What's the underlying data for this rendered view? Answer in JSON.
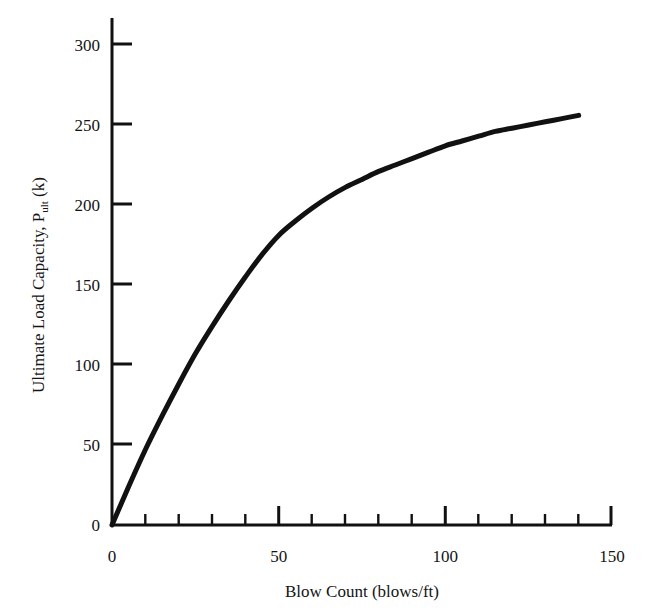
{
  "figure": {
    "cut_off_header_text": "",
    "background_color": "#ffffff",
    "ink_color": "#111111"
  },
  "axes": {
    "x": {
      "title": "Blow Count (blows/ft)",
      "tick_labels": [
        "0",
        "50",
        "100",
        "150"
      ],
      "tick_values": [
        0,
        50,
        100,
        150
      ],
      "minor_tick_step": 10,
      "range": [
        0,
        150
      ]
    },
    "y": {
      "title_main": "Ultimate Load Capacity, P",
      "title_sub": "ult",
      "title_unit": " (k)",
      "tick_labels": [
        "0",
        "50",
        "100",
        "150",
        "200",
        "250",
        "300"
      ],
      "tick_values": [
        0,
        50,
        100,
        150,
        200,
        250,
        300
      ],
      "range": [
        0,
        310
      ]
    }
  },
  "chart_data": {
    "type": "line",
    "title": "",
    "xlabel": "Blow Count (blows/ft)",
    "ylabel": "Ultimate Load Capacity, P_ult (k)",
    "xlim": [
      0,
      150
    ],
    "ylim": [
      0,
      310
    ],
    "grid": false,
    "legend": null,
    "line_color": "#111111",
    "line_width_px": 5,
    "series": [
      {
        "name": "Ultimate Load Capacity vs Blow Count",
        "x": [
          0,
          5,
          10,
          15,
          20,
          25,
          30,
          35,
          40,
          45,
          50,
          55,
          60,
          65,
          70,
          75,
          80,
          85,
          90,
          95,
          100,
          105,
          110,
          115,
          120,
          125,
          130,
          135,
          140
        ],
        "y": [
          0,
          24,
          47,
          68,
          88,
          107,
          124,
          140,
          155,
          169,
          181,
          190,
          198,
          205,
          211,
          216,
          221,
          225,
          229,
          233,
          237,
          240,
          243,
          246,
          248,
          250,
          252,
          254,
          256
        ]
      }
    ]
  }
}
